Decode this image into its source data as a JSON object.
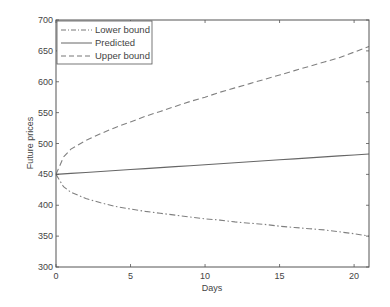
{
  "chart_data": {
    "type": "line",
    "title": "",
    "xlabel": "Days",
    "ylabel": "Future prices",
    "xlim": [
      0,
      21
    ],
    "ylim": [
      300,
      700
    ],
    "xticks": [
      0,
      5,
      10,
      15,
      20
    ],
    "yticks": [
      300,
      350,
      400,
      450,
      500,
      550,
      600,
      650,
      700
    ],
    "grid": false,
    "legend_position": "upper left",
    "x": [
      0,
      0.5,
      1,
      2,
      3,
      4,
      5,
      6,
      7,
      8,
      9,
      10,
      11,
      12,
      13,
      14,
      15,
      16,
      17,
      18,
      19,
      20,
      21
    ],
    "series": [
      {
        "name": "Lower bound",
        "style": "dash-dot",
        "values": [
          450,
          430,
          421,
          411,
          404,
          398,
          394,
          390,
          387,
          384,
          381,
          378,
          376,
          373,
          371,
          369,
          366,
          364,
          362,
          360,
          357,
          354,
          350
        ]
      },
      {
        "name": "Predicted",
        "style": "solid",
        "values": [
          450,
          450.8,
          451.6,
          453.1,
          454.7,
          456.3,
          457.9,
          459.4,
          461,
          462.6,
          464.1,
          465.7,
          467.3,
          468.9,
          470.4,
          472,
          473.6,
          475.1,
          476.7,
          478.3,
          479.9,
          481.4,
          483
        ]
      },
      {
        "name": "Upper bound",
        "style": "dashed",
        "values": [
          450,
          478,
          491,
          505,
          516,
          526,
          535,
          544,
          552,
          560,
          568,
          575,
          583,
          590,
          597,
          604,
          611,
          618,
          625,
          632,
          639,
          648,
          657
        ]
      }
    ]
  },
  "legend": {
    "items": [
      "Lower bound",
      "Predicted",
      "Upper bound"
    ]
  },
  "axes": {
    "xlabel": "Days",
    "ylabel": "Future prices",
    "xtick_labels": [
      "0",
      "5",
      "10",
      "15",
      "20"
    ],
    "ytick_labels": [
      "300",
      "350",
      "400",
      "450",
      "500",
      "550",
      "600",
      "650",
      "700"
    ]
  },
  "colors": {
    "line": "#6e6e6e",
    "axis": "#555555",
    "text": "#444444"
  }
}
